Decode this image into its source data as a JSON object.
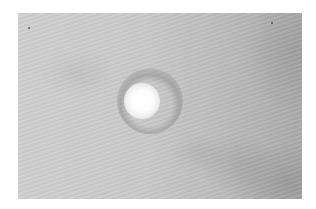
{
  "image": {
    "description": "Grayscale close-up photograph of skin surface with a single round white/depigmented spot surrounded by a slightly darker halo",
    "type": "photograph",
    "colors": {
      "background": "#ffffff",
      "skin_light": "#cfcfcf",
      "skin_dark": "#a9a9a9",
      "spot": "#ffffff"
    }
  }
}
